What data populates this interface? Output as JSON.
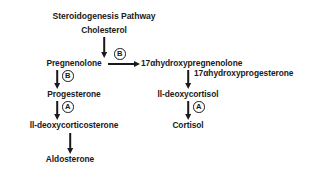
{
  "diagram": {
    "title": "Steroidogenesis Pathway",
    "nodes": {
      "cholesterol": "Cholesterol",
      "pregnenolone": "Pregnenolone",
      "progesterone": "Progesterone",
      "deoxycorticosterone": "ll-deoxycorticosterone",
      "aldosterone": "Aldosterone",
      "hydroxypregnenolone": "17αhydroxypregnenolone",
      "deoxycortisol": "ll-deoxycortisol",
      "cortisol": "Cortisol"
    },
    "edge_labels": {
      "hydroxyprogesterone": "17αhydroxyprogesterone"
    },
    "enzymes": {
      "b_horizontal": "B",
      "b_vertical": "B",
      "a_left": "A",
      "a_right": "A"
    },
    "colors": {
      "ink": "#1a1a1a",
      "background": "#ffffff"
    }
  }
}
